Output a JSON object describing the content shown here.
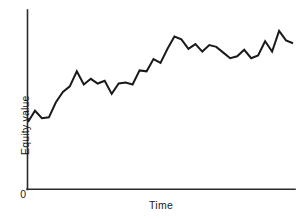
{
  "chart_data": {
    "type": "line",
    "title": "",
    "subtitle": "",
    "xlabel": "Time",
    "ylabel": "Equity value",
    "origin_label": "0",
    "grid": false,
    "legend": null,
    "axis_color": "#2b2b2b",
    "line_color": "#1a1a1a",
    "background_color": "#ffffff",
    "xlim": [
      0,
      40
    ],
    "ylim": [
      0,
      100
    ],
    "xticks": [],
    "yticks": [],
    "xticklabels": [],
    "yticklabels": [],
    "series": [
      {
        "name": "Equity value",
        "x": [
          0,
          1,
          2,
          3,
          4,
          5,
          6,
          7,
          8,
          9,
          10,
          11,
          12,
          13,
          14,
          15,
          16,
          17,
          18,
          19,
          20,
          21,
          22,
          23,
          24,
          25,
          26,
          27,
          28,
          29,
          30,
          31,
          32,
          33,
          34,
          35,
          36,
          37,
          38
        ],
        "values": [
          37.5,
          43.5,
          39.5,
          40.0,
          48.0,
          53.5,
          56.5,
          64.5,
          57.5,
          60.5,
          58.0,
          59.5,
          52.5,
          58.0,
          58.5,
          57.5,
          65.0,
          64.5,
          71.0,
          69.0,
          76.5,
          83.0,
          81.5,
          76.5,
          79.0,
          75.0,
          78.5,
          77.5,
          74.5,
          71.5,
          72.5,
          76.0,
          71.5,
          73.0,
          80.5,
          75.0,
          86.0,
          81.0,
          79.5
        ]
      }
    ],
    "annotations": []
  },
  "figure": {
    "width": 302,
    "height": 219
  }
}
